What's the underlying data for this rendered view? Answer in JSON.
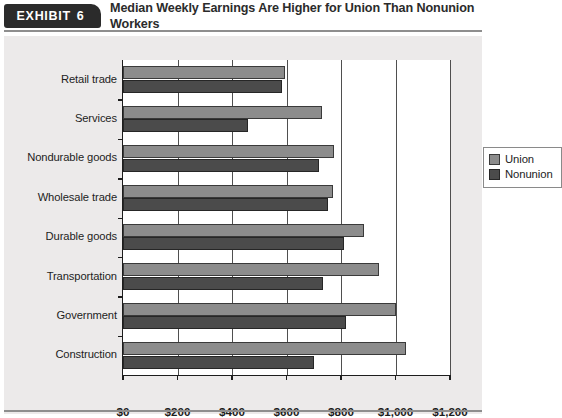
{
  "header": {
    "badge_word": "EXHIBIT",
    "badge_number": "6",
    "title": "Median Weekly Earnings Are Higher for Union Than Nonunion Workers"
  },
  "legend": {
    "items": [
      {
        "label": "Union",
        "color": "#8c8c8c"
      },
      {
        "label": "Nonunion",
        "color": "#4b4b4b"
      }
    ]
  },
  "chart_data": {
    "type": "bar",
    "orientation": "horizontal",
    "title": "Median Weekly Earnings Are Higher for Union Than Nonunion Workers",
    "xlabel": "",
    "ylabel": "",
    "xlim": [
      0,
      1200
    ],
    "xticks": [
      0,
      200,
      400,
      600,
      800,
      1000,
      1200
    ],
    "xtick_labels": [
      "$0",
      "$200",
      "$400",
      "$600",
      "$800",
      "$1,000",
      "$1,200"
    ],
    "grid": true,
    "legend_position": "upper-right-inside",
    "categories": [
      "Retail trade",
      "Services",
      "Nondurable goods",
      "Wholesale trade",
      "Durable goods",
      "Transportation",
      "Government",
      "Construction"
    ],
    "series": [
      {
        "name": "Union",
        "color": "#8c8c8c",
        "values": [
          595,
          730,
          775,
          770,
          885,
          940,
          1000,
          1040
        ]
      },
      {
        "name": "Nonunion",
        "color": "#4b4b4b",
        "values": [
          583,
          460,
          720,
          752,
          810,
          735,
          818,
          700
        ]
      }
    ]
  }
}
